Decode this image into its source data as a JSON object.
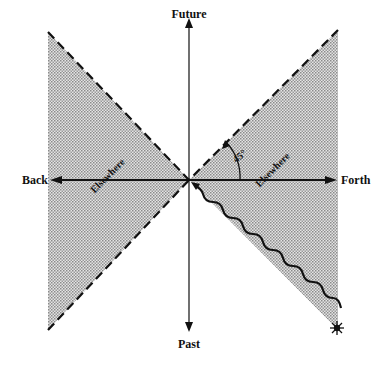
{
  "diagram": {
    "axes": {
      "up": "Future",
      "down": "Past",
      "left": "Back",
      "right": "Forth"
    },
    "regions": [
      {
        "label": "Elsewhere",
        "side": "left"
      },
      {
        "label": "Elsewhere",
        "side": "right"
      }
    ],
    "angle_label": "45°",
    "colors": {
      "line": "#111111",
      "shade": "#c8c8c8",
      "background": "#ffffff"
    }
  }
}
